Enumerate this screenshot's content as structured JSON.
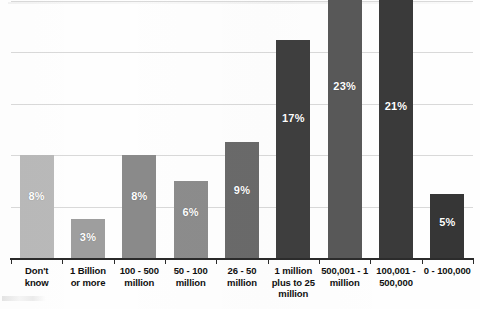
{
  "chart_data": {
    "type": "bar",
    "title": "",
    "subtitle": "",
    "xlabel": "",
    "ylabel": "",
    "categories": [
      "Don't know",
      "1 Billion or more",
      "100 - 500 million",
      "50 - 100 million",
      "26 - 50 million",
      "1 million plus to 25 million",
      "500,001 - 1 million",
      "100,001 - 500,000",
      "0 - 100,000"
    ],
    "category_lines": [
      [
        "Don't",
        "know"
      ],
      [
        "1 Billion",
        "or more"
      ],
      [
        "100 - 500",
        "million"
      ],
      [
        "50 - 100",
        "million"
      ],
      [
        "26 - 50",
        "million"
      ],
      [
        "1 million",
        "plus to 25",
        "million"
      ],
      [
        "500,001 - 1",
        "million"
      ],
      [
        "100,001 -",
        "500,000"
      ],
      [
        "0 - 100,000"
      ]
    ],
    "values": [
      8,
      3,
      8,
      6,
      9,
      17,
      23,
      21,
      5
    ],
    "value_labels": [
      "8%",
      "3%",
      "8%",
      "6%",
      "9%",
      "17%",
      "23%",
      "21%",
      "5%"
    ],
    "bar_colors": [
      "#b9b9b9",
      "#9e9e9e",
      "#8a8a8a",
      "#8c8c8c",
      "#6a6a6a",
      "#3e3e3e",
      "#585858",
      "#3a3a3a",
      "#363636"
    ],
    "ylim": [
      0,
      25
    ],
    "y_tick_values": [
      0,
      4,
      8,
      12,
      16,
      20
    ],
    "grid": true,
    "grid_color": "#d9d9d9",
    "axis_color": "#2b2b2b",
    "legend": "none",
    "value_label_color": "#ffffff"
  }
}
